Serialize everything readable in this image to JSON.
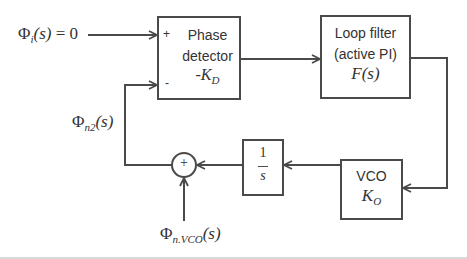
{
  "diagram": {
    "type": "block-diagram",
    "input": {
      "symbol": "Φ",
      "sub": "i",
      "arg": "(s)",
      "suffix": " = 0"
    },
    "feedback_signal": {
      "symbol": "Φ",
      "sub": "n2",
      "arg": "(s)"
    },
    "vco_noise": {
      "symbol": "Φ",
      "sub": "n.VCO",
      "arg": "(s)"
    },
    "blocks": {
      "phase_detector": {
        "line1": "Phase",
        "line2": "detector",
        "gain_prefix": "-K",
        "gain_sub": "D",
        "plus_port": "+",
        "minus_port": "-"
      },
      "loop_filter": {
        "line1": "Loop filter",
        "line2": "(active PI)",
        "transfer": "F(s)"
      },
      "vco": {
        "line1": "VCO",
        "gain": "K",
        "gain_sub": "O"
      },
      "integrator": {
        "numerator": "1",
        "denominator": "s"
      },
      "summer": {
        "sign": "+"
      }
    },
    "colors": {
      "line": "#4a4a4a",
      "text": "#333333",
      "background": "#ffffff"
    }
  }
}
